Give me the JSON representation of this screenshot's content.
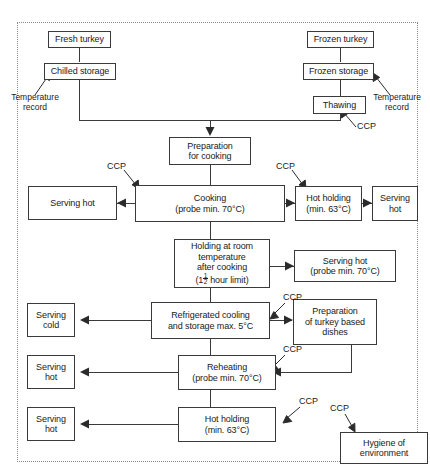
{
  "diagram": {
    "type": "flowchart",
    "annotation_labels": {
      "ccp": "CCP",
      "temperature_record_line1": "Temperature",
      "temperature_record_line2": "record"
    },
    "nodes": {
      "fresh_turkey": {
        "line1": "Fresh turkey"
      },
      "chilled_storage": {
        "line1": "Chilled storage"
      },
      "frozen_turkey": {
        "line1": "Frozen turkey"
      },
      "frozen_storage": {
        "line1": "Frozen storage"
      },
      "thawing": {
        "line1": "Thawing"
      },
      "preparation_for_cooking": {
        "line1": "Preparation",
        "line2": "for cooking"
      },
      "serving_hot_left_cooking": {
        "line1": "Serving hot"
      },
      "cooking": {
        "line1": "Cooking",
        "line2": "(probe min. 70°C)"
      },
      "hot_holding_upper": {
        "line1": "Hot holding",
        "line2": "(min. 63°C)"
      },
      "serving_hot_right": {
        "line1": "Serving",
        "line2": "hot"
      },
      "holding_room_temp": {
        "line1": "Holding at room",
        "line2": "temperature",
        "line3": "after cooking",
        "line4_pre": "(1",
        "line4_frac_num": "1",
        "line4_frac_den": "2",
        "line4_post": " hour limit)"
      },
      "serving_hot_probe": {
        "line1": "Serving hot",
        "line2": "(probe min. 70°C)"
      },
      "serving_cold": {
        "line1": "Serving",
        "line2": "cold"
      },
      "refrigerated_cooling": {
        "line1": "Refrigerated cooling",
        "line2": "and storage max. 5°C"
      },
      "preparation_turkey_dishes": {
        "line1": "Preparation",
        "line2": "of turkey based",
        "line3": "dishes"
      },
      "serving_hot_reheating": {
        "line1": "Serving",
        "line2": "hot"
      },
      "reheating": {
        "line1": "Reheating",
        "line2": "(probe min. 70°C)"
      },
      "serving_hot_holding": {
        "line1": "Serving",
        "line2": "hot"
      },
      "hot_holding_lower": {
        "line1": "Hot holding",
        "line2": "(min. 63°C)"
      },
      "hygiene_of_environment": {
        "line1": "Hygiene of",
        "line2": "environment"
      }
    },
    "ccp_markers": [
      {
        "id": "ccp-thawing",
        "label": "CCP"
      },
      {
        "id": "ccp-cooking",
        "label": "CCP"
      },
      {
        "id": "ccp-hot-holding-upper",
        "label": "CCP"
      },
      {
        "id": "ccp-refrigerated-cooling",
        "label": "CCP"
      },
      {
        "id": "ccp-reheating",
        "label": "CCP"
      },
      {
        "id": "ccp-hot-holding-lower",
        "label": "CCP"
      },
      {
        "id": "ccp-hygiene",
        "label": "CCP"
      }
    ],
    "temperature_record_markers": [
      {
        "id": "temp-record-chilled-storage"
      },
      {
        "id": "temp-record-frozen-storage"
      }
    ]
  }
}
